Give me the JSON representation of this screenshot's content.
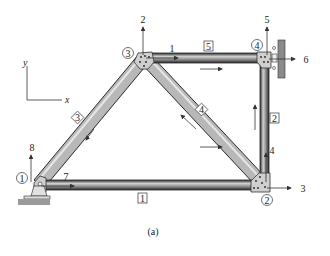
{
  "figure": {
    "caption": "(a)",
    "axes": {
      "x_label": "x",
      "y_label": "y"
    },
    "nodes": [
      {
        "id": "1",
        "label": "1"
      },
      {
        "id": "2",
        "label": "2"
      },
      {
        "id": "3",
        "label": "3"
      },
      {
        "id": "4",
        "label": "4"
      }
    ],
    "members": [
      {
        "id": "1",
        "label": "1"
      },
      {
        "id": "2",
        "label": "2"
      },
      {
        "id": "3",
        "label": "3"
      },
      {
        "id": "4",
        "label": "4"
      },
      {
        "id": "5",
        "label": "5"
      }
    ],
    "dofs": [
      {
        "id": "1",
        "label": "1"
      },
      {
        "id": "2",
        "label": "2"
      },
      {
        "id": "3",
        "label": "3"
      },
      {
        "id": "4",
        "label": "4"
      },
      {
        "id": "5",
        "label": "5"
      },
      {
        "id": "6",
        "label": "6"
      },
      {
        "id": "7",
        "label": "7"
      },
      {
        "id": "8",
        "label": "8"
      }
    ],
    "colors": {
      "member_dark": "#3a3a3a",
      "member_light": "#d8d8d8",
      "gusset": "#c8c8c8",
      "support": "#8a8a8a",
      "ink": "#222222"
    }
  }
}
